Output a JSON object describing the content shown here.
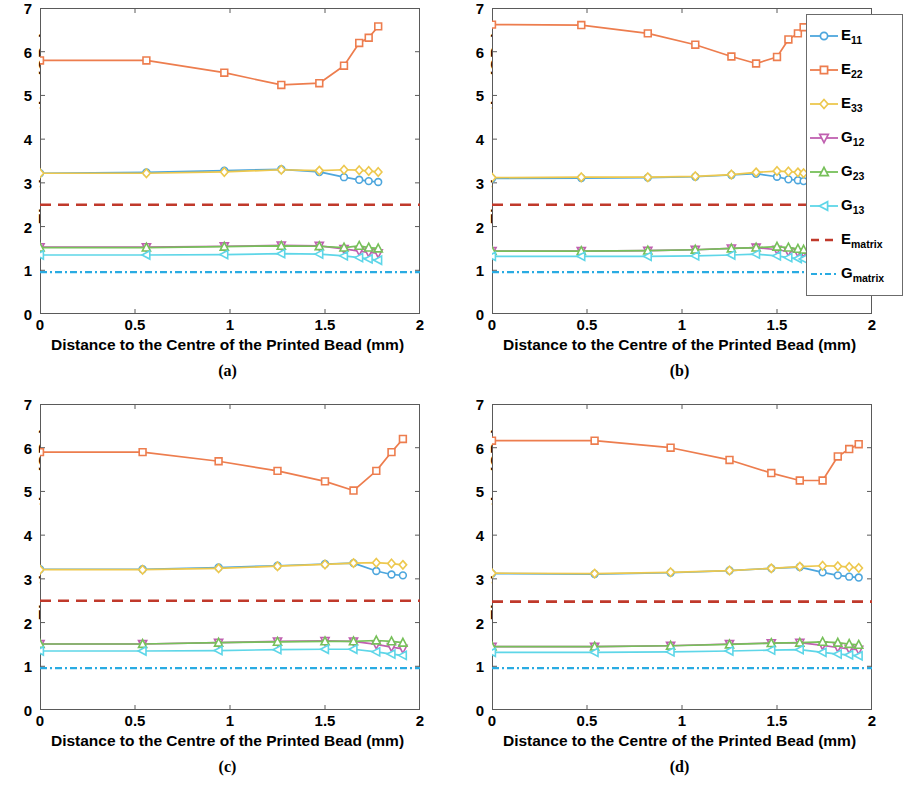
{
  "figure": {
    "ylabel": "Elastic properties (GPa)",
    "xlabel": "Distance to the Centre of the Printed Bead (mm)",
    "yticks": [
      "0",
      "1",
      "2",
      "3",
      "4",
      "5",
      "6",
      "7"
    ],
    "xticks": [
      "0",
      "0.5",
      "1",
      "1.5",
      "2"
    ],
    "panel_letters": {
      "a": "(a)",
      "b": "(b)",
      "c": "(c)",
      "d": "(d)"
    }
  },
  "legend": {
    "title": "",
    "entries": [
      {
        "label_base": "E",
        "label_sub": "11",
        "color": "#4DA6DD",
        "marker": "circle",
        "style": "solid"
      },
      {
        "label_base": "E",
        "label_sub": "22",
        "color": "#ED7D4E",
        "marker": "square",
        "style": "solid"
      },
      {
        "label_base": "E",
        "label_sub": "33",
        "color": "#EDC84E",
        "marker": "diamond",
        "style": "solid"
      },
      {
        "label_base": "G",
        "label_sub": "12",
        "color": "#C060B0",
        "marker": "triangle-down",
        "style": "solid"
      },
      {
        "label_base": "G",
        "label_sub": "23",
        "color": "#77C05A",
        "marker": "triangle-up",
        "style": "solid"
      },
      {
        "label_base": "G",
        "label_sub": "13",
        "color": "#5ED6E8",
        "marker": "triangle-left",
        "style": "solid"
      },
      {
        "label_base": "E",
        "label_sub": "matrix",
        "color": "#C0392B",
        "marker": "none",
        "style": "dashed"
      },
      {
        "label_base": "G",
        "label_sub": "matrix",
        "color": "#29ABE2",
        "marker": "none",
        "style": "dashdot"
      }
    ]
  },
  "chart_data": [
    {
      "id": "a",
      "type": "line",
      "title": "(a)",
      "xlabel": "Distance to the Centre of the Printed Bead (mm)",
      "ylabel": "Elastic properties (GPa)",
      "xlim": [
        0,
        2
      ],
      "ylim": [
        0,
        7
      ],
      "xticks": [
        0,
        0.5,
        1,
        1.5,
        2
      ],
      "yticks": [
        0,
        1,
        2,
        3,
        4,
        5,
        6,
        7
      ],
      "grid": false,
      "legend_position": "none",
      "series": [
        {
          "name": "E11",
          "color": "#4DA6DD",
          "marker": "circle",
          "x": [
            0,
            0.56,
            0.97,
            1.27,
            1.47,
            1.6,
            1.68,
            1.73,
            1.78
          ],
          "y": [
            3.22,
            3.24,
            3.28,
            3.31,
            3.25,
            3.13,
            3.07,
            3.04,
            3.02
          ]
        },
        {
          "name": "E22",
          "color": "#ED7D4E",
          "marker": "square",
          "x": [
            0,
            0.56,
            0.97,
            1.27,
            1.47,
            1.6,
            1.68,
            1.73,
            1.78
          ],
          "y": [
            5.8,
            5.8,
            5.52,
            5.24,
            5.28,
            5.68,
            6.2,
            6.32,
            6.58
          ]
        },
        {
          "name": "E33",
          "color": "#EDC84E",
          "marker": "diamond",
          "x": [
            0,
            0.56,
            0.97,
            1.27,
            1.47,
            1.6,
            1.68,
            1.73,
            1.78
          ],
          "y": [
            3.22,
            3.22,
            3.25,
            3.3,
            3.28,
            3.3,
            3.29,
            3.27,
            3.25
          ]
        },
        {
          "name": "G12",
          "color": "#C060B0",
          "marker": "triangle-down",
          "x": [
            0,
            0.56,
            0.97,
            1.27,
            1.47,
            1.6,
            1.68,
            1.73,
            1.78
          ],
          "y": [
            1.53,
            1.53,
            1.55,
            1.57,
            1.56,
            1.49,
            1.44,
            1.41,
            1.39
          ]
        },
        {
          "name": "G23",
          "color": "#77C05A",
          "marker": "triangle-up",
          "x": [
            0,
            0.56,
            0.97,
            1.27,
            1.47,
            1.6,
            1.68,
            1.73,
            1.78
          ],
          "y": [
            1.52,
            1.52,
            1.54,
            1.56,
            1.55,
            1.52,
            1.56,
            1.52,
            1.5
          ]
        },
        {
          "name": "G13",
          "color": "#5ED6E8",
          "marker": "triangle-left",
          "x": [
            0,
            0.56,
            0.97,
            1.27,
            1.47,
            1.6,
            1.68,
            1.73,
            1.78
          ],
          "y": [
            1.35,
            1.35,
            1.36,
            1.38,
            1.37,
            1.33,
            1.29,
            1.26,
            1.23
          ]
        },
        {
          "name": "Ematrix",
          "color": "#C0392B",
          "style": "dashed",
          "constant": 2.5
        },
        {
          "name": "Gmatrix",
          "color": "#29ABE2",
          "style": "dashdot",
          "constant": 0.96
        }
      ]
    },
    {
      "id": "b",
      "type": "line",
      "title": "(b)",
      "xlabel": "Distance to the Centre of the Printed Bead (mm)",
      "ylabel": "Elastic properties (GPa)",
      "xlim": [
        0,
        2
      ],
      "ylim": [
        0,
        7
      ],
      "xticks": [
        0,
        0.5,
        1,
        1.5,
        2
      ],
      "yticks": [
        0,
        1,
        2,
        3,
        4,
        5,
        6,
        7
      ],
      "grid": false,
      "legend_position": "upper-right",
      "series": [
        {
          "name": "E11",
          "color": "#4DA6DD",
          "marker": "circle",
          "x": [
            0,
            0.47,
            0.82,
            1.07,
            1.26,
            1.39,
            1.5,
            1.56,
            1.61,
            1.64
          ],
          "y": [
            3.1,
            3.11,
            3.12,
            3.14,
            3.18,
            3.21,
            3.14,
            3.08,
            3.06,
            3.04
          ]
        },
        {
          "name": "E22",
          "color": "#ED7D4E",
          "marker": "square",
          "x": [
            0,
            0.47,
            0.82,
            1.07,
            1.26,
            1.39,
            1.5,
            1.56,
            1.61,
            1.64
          ],
          "y": [
            6.62,
            6.61,
            6.42,
            6.16,
            5.89,
            5.73,
            5.88,
            6.28,
            6.42,
            6.56
          ]
        },
        {
          "name": "E33",
          "color": "#EDC84E",
          "marker": "diamond",
          "x": [
            0,
            0.47,
            0.82,
            1.07,
            1.26,
            1.39,
            1.5,
            1.56,
            1.61,
            1.64
          ],
          "y": [
            3.12,
            3.13,
            3.13,
            3.15,
            3.19,
            3.24,
            3.27,
            3.26,
            3.24,
            3.22
          ]
        },
        {
          "name": "G12",
          "color": "#C060B0",
          "marker": "triangle-down",
          "x": [
            0,
            0.47,
            0.82,
            1.07,
            1.26,
            1.39,
            1.5,
            1.56,
            1.61,
            1.64
          ],
          "y": [
            1.44,
            1.44,
            1.45,
            1.47,
            1.5,
            1.52,
            1.47,
            1.43,
            1.41,
            1.4
          ]
        },
        {
          "name": "G23",
          "color": "#77C05A",
          "marker": "triangle-up",
          "x": [
            0,
            0.47,
            0.82,
            1.07,
            1.26,
            1.39,
            1.5,
            1.56,
            1.61,
            1.64
          ],
          "y": [
            1.44,
            1.44,
            1.45,
            1.47,
            1.5,
            1.52,
            1.54,
            1.52,
            1.49,
            1.47
          ]
        },
        {
          "name": "G13",
          "color": "#5ED6E8",
          "marker": "triangle-left",
          "x": [
            0,
            0.47,
            0.82,
            1.07,
            1.26,
            1.39,
            1.5,
            1.56,
            1.61,
            1.64
          ],
          "y": [
            1.32,
            1.32,
            1.32,
            1.33,
            1.35,
            1.37,
            1.33,
            1.29,
            1.27,
            1.26
          ]
        },
        {
          "name": "Ematrix",
          "color": "#C0392B",
          "style": "dashed",
          "constant": 2.5
        },
        {
          "name": "Gmatrix",
          "color": "#29ABE2",
          "style": "dashdot",
          "constant": 0.96
        }
      ]
    },
    {
      "id": "c",
      "type": "line",
      "title": "(c)",
      "xlabel": "Distance to the Centre of the Printed Bead (mm)",
      "ylabel": "Elastic properties (GPa)",
      "xlim": [
        0,
        2
      ],
      "ylim": [
        0,
        7
      ],
      "xticks": [
        0,
        0.5,
        1,
        1.5,
        2
      ],
      "yticks": [
        0,
        1,
        2,
        3,
        4,
        5,
        6,
        7
      ],
      "grid": false,
      "legend_position": "none",
      "series": [
        {
          "name": "E11",
          "color": "#4DA6DD",
          "marker": "circle",
          "x": [
            0,
            0.54,
            0.94,
            1.25,
            1.5,
            1.65,
            1.77,
            1.85,
            1.91
          ],
          "y": [
            3.22,
            3.22,
            3.26,
            3.3,
            3.34,
            3.36,
            3.18,
            3.1,
            3.08
          ]
        },
        {
          "name": "E22",
          "color": "#ED7D4E",
          "marker": "square",
          "x": [
            0,
            0.54,
            0.94,
            1.25,
            1.5,
            1.65,
            1.77,
            1.85,
            1.91
          ],
          "y": [
            5.9,
            5.9,
            5.69,
            5.47,
            5.23,
            5.02,
            5.47,
            5.9,
            6.2
          ]
        },
        {
          "name": "E33",
          "color": "#EDC84E",
          "marker": "diamond",
          "x": [
            0,
            0.54,
            0.94,
            1.25,
            1.5,
            1.65,
            1.77,
            1.85,
            1.91
          ],
          "y": [
            3.21,
            3.21,
            3.24,
            3.29,
            3.33,
            3.36,
            3.37,
            3.35,
            3.32
          ]
        },
        {
          "name": "G12",
          "color": "#C060B0",
          "marker": "triangle-down",
          "x": [
            0,
            0.54,
            0.94,
            1.25,
            1.5,
            1.65,
            1.77,
            1.85,
            1.91
          ],
          "y": [
            1.51,
            1.51,
            1.54,
            1.57,
            1.58,
            1.57,
            1.5,
            1.44,
            1.4
          ]
        },
        {
          "name": "G23",
          "color": "#77C05A",
          "marker": "triangle-up",
          "x": [
            0,
            0.54,
            0.94,
            1.25,
            1.5,
            1.65,
            1.77,
            1.85,
            1.91
          ],
          "y": [
            1.51,
            1.51,
            1.54,
            1.56,
            1.57,
            1.57,
            1.59,
            1.57,
            1.54
          ]
        },
        {
          "name": "G13",
          "color": "#5ED6E8",
          "marker": "triangle-left",
          "x": [
            0,
            0.54,
            0.94,
            1.25,
            1.5,
            1.65,
            1.77,
            1.85,
            1.91
          ],
          "y": [
            1.35,
            1.35,
            1.36,
            1.38,
            1.39,
            1.39,
            1.33,
            1.28,
            1.25
          ]
        },
        {
          "name": "Ematrix",
          "color": "#C0392B",
          "style": "dashed",
          "constant": 2.5
        },
        {
          "name": "Gmatrix",
          "color": "#29ABE2",
          "style": "dashdot",
          "constant": 0.96
        }
      ]
    },
    {
      "id": "d",
      "type": "line",
      "title": "(d)",
      "xlabel": "Distance to the Centre of the Printed Bead (mm)",
      "ylabel": "Elastic properties (GPa)",
      "xlim": [
        0,
        2
      ],
      "ylim": [
        0,
        7
      ],
      "xticks": [
        0,
        0.5,
        1,
        1.5,
        2
      ],
      "yticks": [
        0,
        1,
        2,
        3,
        4,
        5,
        6,
        7
      ],
      "grid": false,
      "legend_position": "none",
      "series": [
        {
          "name": "E11",
          "color": "#4DA6DD",
          "marker": "circle",
          "x": [
            0,
            0.54,
            0.94,
            1.25,
            1.47,
            1.62,
            1.74,
            1.82,
            1.88,
            1.93
          ],
          "y": [
            3.12,
            3.11,
            3.14,
            3.19,
            3.24,
            3.27,
            3.15,
            3.08,
            3.05,
            3.03
          ]
        },
        {
          "name": "E22",
          "color": "#ED7D4E",
          "marker": "square",
          "x": [
            0,
            0.54,
            0.94,
            1.25,
            1.47,
            1.62,
            1.74,
            1.82,
            1.88,
            1.93
          ],
          "y": [
            6.16,
            6.16,
            6.0,
            5.72,
            5.42,
            5.25,
            5.25,
            5.8,
            5.97,
            6.08
          ]
        },
        {
          "name": "E33",
          "color": "#EDC84E",
          "marker": "diamond",
          "x": [
            0,
            0.54,
            0.94,
            1.25,
            1.47,
            1.62,
            1.74,
            1.82,
            1.88,
            1.93
          ],
          "y": [
            3.13,
            3.12,
            3.15,
            3.19,
            3.24,
            3.28,
            3.3,
            3.29,
            3.27,
            3.25
          ]
        },
        {
          "name": "G12",
          "color": "#C060B0",
          "marker": "triangle-down",
          "x": [
            0,
            0.54,
            0.94,
            1.25,
            1.47,
            1.62,
            1.74,
            1.82,
            1.88,
            1.93
          ],
          "y": [
            1.45,
            1.45,
            1.47,
            1.51,
            1.53,
            1.54,
            1.48,
            1.43,
            1.4,
            1.38
          ]
        },
        {
          "name": "G23",
          "color": "#77C05A",
          "marker": "triangle-up",
          "x": [
            0,
            0.54,
            0.94,
            1.25,
            1.47,
            1.62,
            1.74,
            1.82,
            1.88,
            1.93
          ],
          "y": [
            1.45,
            1.45,
            1.47,
            1.5,
            1.53,
            1.54,
            1.56,
            1.54,
            1.51,
            1.49
          ]
        },
        {
          "name": "G13",
          "color": "#5ED6E8",
          "marker": "triangle-left",
          "x": [
            0,
            0.54,
            0.94,
            1.25,
            1.47,
            1.62,
            1.74,
            1.82,
            1.88,
            1.93
          ],
          "y": [
            1.32,
            1.32,
            1.33,
            1.35,
            1.37,
            1.38,
            1.32,
            1.28,
            1.26,
            1.24
          ]
        },
        {
          "name": "Ematrix",
          "color": "#C0392B",
          "style": "dashed",
          "constant": 2.48
        },
        {
          "name": "Gmatrix",
          "color": "#29ABE2",
          "style": "dashdot",
          "constant": 0.96
        }
      ]
    }
  ]
}
